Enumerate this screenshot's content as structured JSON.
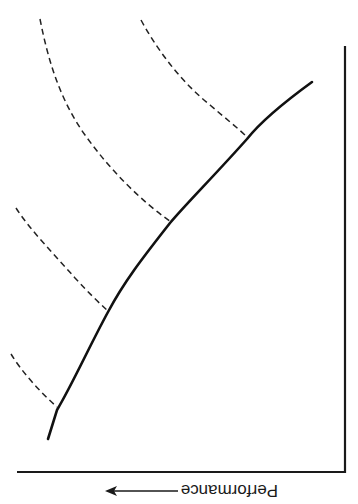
{
  "figure": {
    "orientation": "rotated 180 degrees",
    "axis_label": "Performance",
    "arrow": "left-pointing arrow next to axis label",
    "colors": {
      "line": "#111111",
      "background": "#ffffff"
    }
  },
  "curves": {
    "main": {
      "style": "solid",
      "description": "primary curve rising diagonally"
    },
    "secondary": [
      {
        "style": "dashed",
        "index": 1
      },
      {
        "style": "dashed",
        "index": 2
      },
      {
        "style": "dashed",
        "index": 3
      },
      {
        "style": "dashed",
        "index": 4
      }
    ]
  }
}
